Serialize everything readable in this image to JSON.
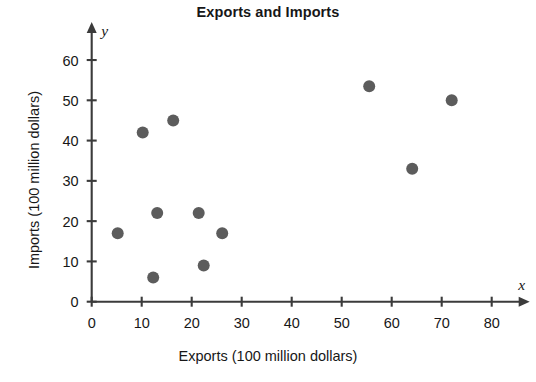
{
  "chart_data": {
    "type": "scatter",
    "title": "Exports and Imports",
    "xlabel": "Exports (100 million dollars)",
    "ylabel": "Imports (100 million dollars)",
    "x_axis_letter": "x",
    "y_axis_letter": "y",
    "xlim": [
      0,
      84
    ],
    "ylim": [
      0,
      64
    ],
    "xticks": [
      0,
      10,
      20,
      30,
      40,
      50,
      60,
      70,
      80
    ],
    "yticks": [
      0,
      10,
      20,
      30,
      40,
      50,
      60
    ],
    "xtick_labels": [
      "0",
      "10",
      "20",
      "30",
      "40",
      "50",
      "60",
      "70",
      "80"
    ],
    "ytick_labels": [
      "0",
      "10",
      "20",
      "30",
      "40",
      "50",
      "60"
    ],
    "grid": false,
    "legend": false,
    "marker_color": "#5c5c5c",
    "marker_radius": 6,
    "points": [
      {
        "x": 5.2,
        "y": 17.0
      },
      {
        "x": 10.2,
        "y": 42.0
      },
      {
        "x": 12.3,
        "y": 6.0
      },
      {
        "x": 13.1,
        "y": 22.0
      },
      {
        "x": 16.3,
        "y": 45.0
      },
      {
        "x": 21.4,
        "y": 22.0
      },
      {
        "x": 22.4,
        "y": 9.0
      },
      {
        "x": 26.1,
        "y": 17.0
      },
      {
        "x": 55.5,
        "y": 53.5
      },
      {
        "x": 64.1,
        "y": 33.0
      },
      {
        "x": 72.0,
        "y": 50.0
      }
    ]
  }
}
